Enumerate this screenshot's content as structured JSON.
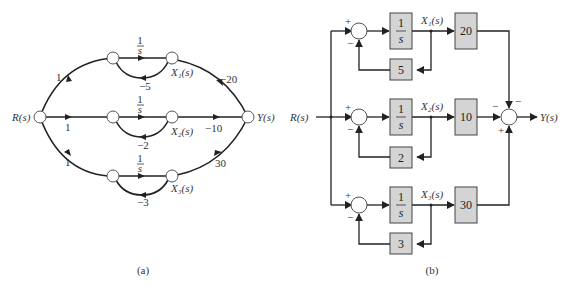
{
  "panel_a": {
    "caption": "(a)",
    "input_label": "R(s)",
    "output_label": "Y(s)",
    "branches": [
      {
        "input_gain": "1",
        "integrator_num": "1",
        "integrator_den": "s",
        "state_label": "X₁(s)",
        "feedback_gain": "−5",
        "output_gain": "−20"
      },
      {
        "input_gain": "1",
        "integrator_num": "1",
        "integrator_den": "s",
        "state_label": "X₂(s)",
        "feedback_gain": "−2",
        "output_gain": "−10"
      },
      {
        "input_gain": "1",
        "integrator_num": "1",
        "integrator_den": "s",
        "state_label": "X₃(s)",
        "feedback_gain": "−3",
        "output_gain": "30"
      }
    ]
  },
  "panel_b": {
    "caption": "(b)",
    "input_label": "R(s)",
    "output_label": "Y(s)",
    "branches": [
      {
        "integrator_num": "1",
        "integrator_den": "s",
        "state_label": "X₁(s)",
        "feedback_gain": "5",
        "output_gain": "20",
        "sum_plus": "+",
        "sum_minus": "−",
        "out_sign": "−"
      },
      {
        "integrator_num": "1",
        "integrator_den": "s",
        "state_label": "X₂(s)",
        "feedback_gain": "2",
        "output_gain": "10",
        "sum_plus": "+",
        "sum_minus": "−",
        "out_sign": "−"
      },
      {
        "integrator_num": "1",
        "integrator_den": "s",
        "state_label": "X₃(s)",
        "feedback_gain": "3",
        "output_gain": "30",
        "sum_plus": "+",
        "sum_minus": "−",
        "out_sign": "+"
      }
    ]
  }
}
